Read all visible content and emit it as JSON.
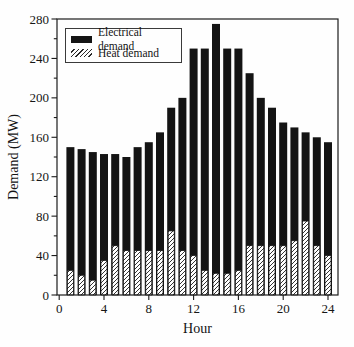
{
  "chart_data": {
    "type": "bar",
    "title": "",
    "xlabel": "Hour",
    "ylabel": "Demand (MW)",
    "x": [
      1,
      2,
      3,
      4,
      5,
      6,
      7,
      8,
      9,
      10,
      11,
      12,
      13,
      14,
      15,
      16,
      17,
      18,
      19,
      20,
      21,
      22,
      23,
      24
    ],
    "series": [
      {
        "name": "Electrical demand",
        "pattern": "solid-black",
        "values": [
          150,
          148,
          145,
          143,
          143,
          140,
          150,
          155,
          165,
          190,
          200,
          250,
          250,
          275,
          250,
          250,
          225,
          200,
          190,
          175,
          170,
          165,
          160,
          155
        ]
      },
      {
        "name": "Heat demand",
        "pattern": "diagonal-hatch",
        "values": [
          25,
          20,
          15,
          35,
          50,
          45,
          45,
          45,
          45,
          65,
          45,
          40,
          25,
          22,
          22,
          25,
          50,
          50,
          50,
          50,
          55,
          75,
          50,
          40
        ]
      }
    ],
    "xlim": [
      0,
      24
    ],
    "ylim": [
      0,
      280
    ],
    "x_major_ticks": [
      0,
      4,
      8,
      12,
      16,
      20,
      24
    ],
    "y_major_ticks": [
      0,
      40,
      80,
      120,
      160,
      200,
      240,
      280
    ],
    "y_minor_tick_step": 20,
    "grid": false,
    "legend_position": "top-left",
    "colors": {
      "bar": "#141414",
      "frame": "#1c1c1c",
      "background": "#fefefe",
      "text": "#141414"
    }
  }
}
